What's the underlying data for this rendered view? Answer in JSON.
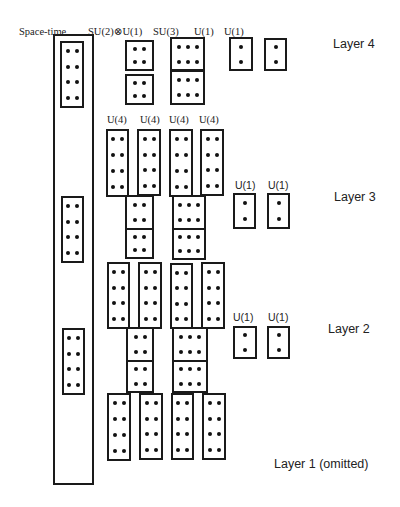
{
  "figure": {
    "background": "#ffffff",
    "stroke_color": "#1a1a1a",
    "dot_color": "#111111"
  },
  "header_labels": [
    {
      "id": "space-time",
      "text": "Space-time",
      "x": 19,
      "y": 27,
      "font": "serif"
    },
    {
      "id": "su2xu1",
      "text": "SU(2)⊗U(1)",
      "x": 88,
      "y": 27,
      "font": "serif"
    },
    {
      "id": "su3",
      "text": "SU(3)",
      "x": 153,
      "y": 27,
      "font": "serif"
    },
    {
      "id": "u1-a",
      "text": "U(1)",
      "x": 194,
      "y": 27,
      "font": "serif"
    },
    {
      "id": "u1-b",
      "text": "U(1)",
      "x": 224,
      "y": 27,
      "font": "serif"
    }
  ],
  "group_labels": [
    {
      "id": "l3-u4-1",
      "text": "U(4)",
      "x": 107,
      "y": 115,
      "font": "serif"
    },
    {
      "id": "l3-u4-2",
      "text": "U(4)",
      "x": 140,
      "y": 115,
      "font": "serif"
    },
    {
      "id": "l3-u4-3",
      "text": "U(4)",
      "x": 169,
      "y": 115,
      "font": "serif"
    },
    {
      "id": "l3-u4-4",
      "text": "U(4)",
      "x": 199,
      "y": 115,
      "font": "serif"
    },
    {
      "id": "l3-u1-1",
      "text": "U(1)",
      "x": 235,
      "y": 180,
      "font": "sans"
    },
    {
      "id": "l3-u1-2",
      "text": "U(1)",
      "x": 268,
      "y": 180,
      "font": "sans"
    },
    {
      "id": "l2-u1-1",
      "text": "U(1)",
      "x": 233,
      "y": 312,
      "font": "sans"
    },
    {
      "id": "l2-u1-2",
      "text": "U(1)",
      "x": 268,
      "y": 312,
      "font": "sans"
    }
  ],
  "layer_labels": [
    {
      "id": "layer-4",
      "text": "Layer 4",
      "x": 333,
      "y": 38
    },
    {
      "id": "layer-3",
      "text": "Layer 3",
      "x": 334,
      "y": 191
    },
    {
      "id": "layer-2",
      "text": "Layer 2",
      "x": 328,
      "y": 323
    },
    {
      "id": "layer-1",
      "text": "Layer 1 (omitted)",
      "x": 274,
      "y": 458
    }
  ],
  "spacetime_column": {
    "x": 53,
    "y": 34,
    "w": 41,
    "h": 451
  },
  "boxes": [
    {
      "id": "st-l4",
      "group": "space-time",
      "layer": 4,
      "x": 60,
      "y": 41,
      "w": 24,
      "h": 67,
      "cols": 2,
      "rows": 4
    },
    {
      "id": "st-l3",
      "group": "space-time",
      "layer": 3,
      "x": 61,
      "y": 196,
      "w": 23,
      "h": 67,
      "cols": 2,
      "rows": 4
    },
    {
      "id": "st-l2",
      "group": "space-time",
      "layer": 2,
      "x": 62,
      "y": 328,
      "w": 23,
      "h": 67,
      "cols": 2,
      "rows": 4
    },
    {
      "id": "l4-su2-a",
      "group": "SU(2)⊗U(1)",
      "layer": 4,
      "x": 125,
      "y": 40,
      "w": 29,
      "h": 31,
      "cols": 2,
      "rows": 2
    },
    {
      "id": "l4-su2-b",
      "group": "SU(2)⊗U(1)",
      "layer": 4,
      "x": 125,
      "y": 74,
      "w": 29,
      "h": 31,
      "cols": 2,
      "rows": 2
    },
    {
      "id": "l4-su3-a",
      "group": "SU(3)",
      "layer": 4,
      "x": 170,
      "y": 37,
      "w": 35,
      "h": 34,
      "cols": 3,
      "rows": 2
    },
    {
      "id": "l4-su3-b",
      "group": "SU(3)",
      "layer": 4,
      "x": 170,
      "y": 70,
      "w": 35,
      "h": 35,
      "cols": 3,
      "rows": 2
    },
    {
      "id": "l4-u1-a",
      "group": "U(1)",
      "layer": 4,
      "x": 229,
      "y": 37,
      "w": 24,
      "h": 34,
      "cols": 1,
      "rows": 2
    },
    {
      "id": "l4-u1-b",
      "group": "U(1)",
      "layer": 4,
      "x": 264,
      "y": 38,
      "w": 23,
      "h": 33,
      "cols": 1,
      "rows": 2
    },
    {
      "id": "l3-u4-1",
      "group": "U(4)",
      "layer": 3,
      "x": 106,
      "y": 129,
      "w": 23,
      "h": 68,
      "cols": 2,
      "rows": 4
    },
    {
      "id": "l3-u4-2",
      "group": "U(4)",
      "layer": 3,
      "x": 137,
      "y": 129,
      "w": 24,
      "h": 67,
      "cols": 2,
      "rows": 4
    },
    {
      "id": "l3-u4-3",
      "group": "U(4)",
      "layer": 3,
      "x": 169,
      "y": 129,
      "w": 24,
      "h": 68,
      "cols": 2,
      "rows": 4
    },
    {
      "id": "l3-u4-4",
      "group": "U(4)",
      "layer": 3,
      "x": 200,
      "y": 129,
      "w": 24,
      "h": 67,
      "cols": 2,
      "rows": 4
    },
    {
      "id": "l3-su2-a",
      "group": "SU(2)⊗U(1)",
      "layer": 3,
      "x": 125,
      "y": 195,
      "w": 29,
      "h": 35,
      "cols": 2,
      "rows": 2
    },
    {
      "id": "l3-su2-b",
      "group": "SU(2)⊗U(1)",
      "layer": 3,
      "x": 125,
      "y": 228,
      "w": 29,
      "h": 31,
      "cols": 2,
      "rows": 2
    },
    {
      "id": "l3-su3-a",
      "group": "SU(3)",
      "layer": 3,
      "x": 172,
      "y": 195,
      "w": 34,
      "h": 35,
      "cols": 3,
      "rows": 2
    },
    {
      "id": "l3-su3-b",
      "group": "SU(3)",
      "layer": 3,
      "x": 172,
      "y": 228,
      "w": 34,
      "h": 32,
      "cols": 3,
      "rows": 2
    },
    {
      "id": "l3-u1-a",
      "group": "U(1)",
      "layer": 3,
      "x": 233,
      "y": 193,
      "w": 23,
      "h": 36,
      "cols": 1,
      "rows": 2
    },
    {
      "id": "l3-u1-b",
      "group": "U(1)",
      "layer": 3,
      "x": 267,
      "y": 193,
      "w": 23,
      "h": 36,
      "cols": 1,
      "rows": 2
    },
    {
      "id": "l2-u4-1",
      "group": "U(4)",
      "layer": 2,
      "x": 107,
      "y": 262,
      "w": 23,
      "h": 67,
      "cols": 2,
      "rows": 4
    },
    {
      "id": "l2-u4-2",
      "group": "U(4)",
      "layer": 2,
      "x": 138,
      "y": 262,
      "w": 24,
      "h": 67,
      "cols": 2,
      "rows": 4
    },
    {
      "id": "l2-u4-3",
      "group": "U(4)",
      "layer": 2,
      "x": 170,
      "y": 263,
      "w": 23,
      "h": 66,
      "cols": 2,
      "rows": 4
    },
    {
      "id": "l2-u4-4",
      "group": "U(4)",
      "layer": 2,
      "x": 201,
      "y": 262,
      "w": 24,
      "h": 67,
      "cols": 2,
      "rows": 4
    },
    {
      "id": "l2-su2-a",
      "group": "SU(2)⊗U(1)",
      "layer": 2,
      "x": 126,
      "y": 327,
      "w": 28,
      "h": 35,
      "cols": 2,
      "rows": 2
    },
    {
      "id": "l2-su2-b",
      "group": "SU(2)⊗U(1)",
      "layer": 2,
      "x": 126,
      "y": 360,
      "w": 28,
      "h": 33,
      "cols": 2,
      "rows": 2
    },
    {
      "id": "l2-su3-a",
      "group": "SU(3)",
      "layer": 2,
      "x": 172,
      "y": 327,
      "w": 36,
      "h": 35,
      "cols": 3,
      "rows": 2
    },
    {
      "id": "l2-su3-b",
      "group": "SU(3)",
      "layer": 2,
      "x": 172,
      "y": 360,
      "w": 36,
      "h": 33,
      "cols": 3,
      "rows": 2
    },
    {
      "id": "l2-u1-a",
      "group": "U(1)",
      "layer": 2,
      "x": 233,
      "y": 326,
      "w": 24,
      "h": 33,
      "cols": 1,
      "rows": 2
    },
    {
      "id": "l2-u1-b",
      "group": "U(1)",
      "layer": 2,
      "x": 267,
      "y": 326,
      "w": 23,
      "h": 33,
      "cols": 1,
      "rows": 2
    },
    {
      "id": "l1-u4-1",
      "group": "U(4)",
      "layer": 1,
      "x": 107,
      "y": 393,
      "w": 24,
      "h": 68,
      "cols": 2,
      "rows": 4
    },
    {
      "id": "l1-u4-2",
      "group": "U(4)",
      "layer": 1,
      "x": 139,
      "y": 393,
      "w": 24,
      "h": 67,
      "cols": 2,
      "rows": 4
    },
    {
      "id": "l1-u4-3",
      "group": "U(4)",
      "layer": 1,
      "x": 171,
      "y": 393,
      "w": 23,
      "h": 67,
      "cols": 2,
      "rows": 4
    },
    {
      "id": "l1-u4-4",
      "group": "U(4)",
      "layer": 1,
      "x": 202,
      "y": 393,
      "w": 24,
      "h": 67,
      "cols": 2,
      "rows": 4
    }
  ]
}
